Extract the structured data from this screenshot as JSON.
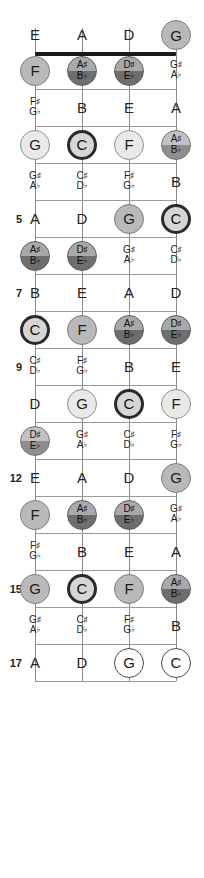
{
  "diagram": {
    "instrument": "4-string bass",
    "tuning": [
      "E",
      "A",
      "D",
      "G"
    ],
    "fret_range": [
      0,
      17
    ],
    "fret_markers": [
      "5",
      "7",
      "9",
      "12",
      "15",
      "17"
    ],
    "legend": {
      "root_color": "#2a2a2a",
      "scale_color": "#b9b9b9",
      "open_color": "#ffffff",
      "accidental_top": "#c2c2c2",
      "accidental_bottom": "#8e8e8e",
      "string_color": "#8a8a8a",
      "fret_color": "#9a9a9a",
      "nut_color": "#1a1a1a"
    }
  },
  "strings": [
    {
      "name": "string-1",
      "open_note": "E",
      "x": 35
    },
    {
      "name": "string-2",
      "open_note": "A",
      "x": 82
    },
    {
      "name": "string-3",
      "open_note": "D",
      "x": 129
    },
    {
      "name": "string-4",
      "open_note": "G",
      "x": 176
    }
  ],
  "fret_numbers": [
    {
      "label": "5",
      "y": 274
    },
    {
      "label": "7",
      "y": 348
    },
    {
      "label": "9",
      "y": 422
    },
    {
      "label": "12",
      "y": 570
    },
    {
      "label": "15",
      "y": 718
    },
    {
      "label": "17",
      "y": 829
    }
  ],
  "notes": [
    {
      "fret": 0,
      "string": 1,
      "style": "plain",
      "text": "E"
    },
    {
      "fret": 0,
      "string": 2,
      "style": "plain",
      "text": "A"
    },
    {
      "fret": 0,
      "string": 3,
      "style": "plain",
      "text": "D"
    },
    {
      "fret": 0,
      "string": 4,
      "style": "circle",
      "fill": "f-mid",
      "text": "G"
    },
    {
      "fret": 1,
      "string": 1,
      "style": "circle",
      "fill": "f-mid",
      "text": "F"
    },
    {
      "fret": 1,
      "string": 2,
      "style": "circle-pair",
      "fill": "f-half-d",
      "sharp": "A",
      "flat": "B"
    },
    {
      "fret": 1,
      "string": 3,
      "style": "circle-pair",
      "fill": "f-half-d",
      "sharp": "D",
      "flat": "E"
    },
    {
      "fret": 1,
      "string": 4,
      "style": "pair",
      "sharp": "G",
      "flat": "A"
    },
    {
      "fret": 2,
      "string": 1,
      "style": "pair",
      "sharp": "F",
      "flat": "G"
    },
    {
      "fret": 2,
      "string": 2,
      "style": "plain",
      "text": "B"
    },
    {
      "fret": 2,
      "string": 3,
      "style": "plain",
      "text": "E"
    },
    {
      "fret": 2,
      "string": 4,
      "style": "plain",
      "text": "A"
    },
    {
      "fret": 3,
      "string": 1,
      "style": "circle",
      "fill": "f-lite",
      "text": "G"
    },
    {
      "fret": 3,
      "string": 2,
      "style": "circle",
      "fill": "f-root",
      "text": "C"
    },
    {
      "fret": 3,
      "string": 3,
      "style": "circle",
      "fill": "f-lite",
      "text": "F"
    },
    {
      "fret": 3,
      "string": 4,
      "style": "circle-pair",
      "fill": "f-half",
      "sharp": "A",
      "flat": "B"
    },
    {
      "fret": 4,
      "string": 1,
      "style": "pair",
      "sharp": "G",
      "flat": "A"
    },
    {
      "fret": 4,
      "string": 2,
      "style": "pair",
      "sharp": "C",
      "flat": "D"
    },
    {
      "fret": 4,
      "string": 3,
      "style": "pair",
      "sharp": "F",
      "flat": "G"
    },
    {
      "fret": 4,
      "string": 4,
      "style": "plain",
      "text": "B"
    },
    {
      "fret": 5,
      "string": 1,
      "style": "plain",
      "text": "A"
    },
    {
      "fret": 5,
      "string": 2,
      "style": "plain",
      "text": "D"
    },
    {
      "fret": 5,
      "string": 3,
      "style": "circle",
      "fill": "f-mid",
      "text": "G"
    },
    {
      "fret": 5,
      "string": 4,
      "style": "circle",
      "fill": "f-root",
      "text": "C"
    },
    {
      "fret": 6,
      "string": 1,
      "style": "circle-pair",
      "fill": "f-half-d",
      "sharp": "A",
      "flat": "B"
    },
    {
      "fret": 6,
      "string": 2,
      "style": "circle-pair",
      "fill": "f-half-d",
      "sharp": "D",
      "flat": "E"
    },
    {
      "fret": 6,
      "string": 3,
      "style": "pair",
      "sharp": "G",
      "flat": "A"
    },
    {
      "fret": 6,
      "string": 4,
      "style": "pair",
      "sharp": "C",
      "flat": "D"
    },
    {
      "fret": 7,
      "string": 1,
      "style": "plain",
      "text": "B"
    },
    {
      "fret": 7,
      "string": 2,
      "style": "plain",
      "text": "E"
    },
    {
      "fret": 7,
      "string": 3,
      "style": "plain",
      "text": "A"
    },
    {
      "fret": 7,
      "string": 4,
      "style": "plain",
      "text": "D"
    },
    {
      "fret": 8,
      "string": 1,
      "style": "circle",
      "fill": "f-root",
      "text": "C"
    },
    {
      "fret": 8,
      "string": 2,
      "style": "circle",
      "fill": "f-mid",
      "text": "F"
    },
    {
      "fret": 8,
      "string": 3,
      "style": "circle-pair",
      "fill": "f-half-d",
      "sharp": "A",
      "flat": "B"
    },
    {
      "fret": 8,
      "string": 4,
      "style": "circle-pair",
      "fill": "f-half-d",
      "sharp": "D",
      "flat": "E"
    },
    {
      "fret": 9,
      "string": 1,
      "style": "pair",
      "sharp": "C",
      "flat": "D"
    },
    {
      "fret": 9,
      "string": 2,
      "style": "pair",
      "sharp": "F",
      "flat": "G"
    },
    {
      "fret": 9,
      "string": 3,
      "style": "plain",
      "text": "B"
    },
    {
      "fret": 9,
      "string": 4,
      "style": "plain",
      "text": "E"
    },
    {
      "fret": 10,
      "string": 1,
      "style": "plain",
      "text": "D"
    },
    {
      "fret": 10,
      "string": 2,
      "style": "circle",
      "fill": "f-lite",
      "text": "G"
    },
    {
      "fret": 10,
      "string": 3,
      "style": "circle",
      "fill": "f-root",
      "text": "C"
    },
    {
      "fret": 10,
      "string": 4,
      "style": "circle",
      "fill": "f-lite",
      "text": "F"
    },
    {
      "fret": 11,
      "string": 1,
      "style": "circle-pair",
      "fill": "f-half",
      "sharp": "D",
      "flat": "E"
    },
    {
      "fret": 11,
      "string": 2,
      "style": "pair",
      "sharp": "G",
      "flat": "A"
    },
    {
      "fret": 11,
      "string": 3,
      "style": "pair",
      "sharp": "C",
      "flat": "D"
    },
    {
      "fret": 11,
      "string": 4,
      "style": "pair",
      "sharp": "F",
      "flat": "G"
    },
    {
      "fret": 12,
      "string": 1,
      "style": "plain",
      "text": "E"
    },
    {
      "fret": 12,
      "string": 2,
      "style": "plain",
      "text": "A"
    },
    {
      "fret": 12,
      "string": 3,
      "style": "plain",
      "text": "D"
    },
    {
      "fret": 12,
      "string": 4,
      "style": "circle",
      "fill": "f-mid",
      "text": "G"
    },
    {
      "fret": 13,
      "string": 1,
      "style": "circle",
      "fill": "f-mid",
      "text": "F"
    },
    {
      "fret": 13,
      "string": 2,
      "style": "circle-pair",
      "fill": "f-half-d",
      "sharp": "A",
      "flat": "B"
    },
    {
      "fret": 13,
      "string": 3,
      "style": "circle-pair",
      "fill": "f-half-d",
      "sharp": "D",
      "flat": "E"
    },
    {
      "fret": 13,
      "string": 4,
      "style": "pair",
      "sharp": "G",
      "flat": "A"
    },
    {
      "fret": 14,
      "string": 1,
      "style": "pair",
      "sharp": "F",
      "flat": "G"
    },
    {
      "fret": 14,
      "string": 2,
      "style": "plain",
      "text": "B"
    },
    {
      "fret": 14,
      "string": 3,
      "style": "plain",
      "text": "E"
    },
    {
      "fret": 14,
      "string": 4,
      "style": "plain",
      "text": "A"
    },
    {
      "fret": 15,
      "string": 1,
      "style": "circle",
      "fill": "f-mid",
      "text": "G"
    },
    {
      "fret": 15,
      "string": 2,
      "style": "circle",
      "fill": "f-root",
      "text": "C"
    },
    {
      "fret": 15,
      "string": 3,
      "style": "circle",
      "fill": "f-mid",
      "text": "F"
    },
    {
      "fret": 15,
      "string": 4,
      "style": "circle-pair",
      "fill": "f-half-d",
      "sharp": "A",
      "flat": "B"
    },
    {
      "fret": 16,
      "string": 1,
      "style": "pair",
      "sharp": "G",
      "flat": "A"
    },
    {
      "fret": 16,
      "string": 2,
      "style": "pair",
      "sharp": "C",
      "flat": "D"
    },
    {
      "fret": 16,
      "string": 3,
      "style": "pair",
      "sharp": "F",
      "flat": "G"
    },
    {
      "fret": 16,
      "string": 4,
      "style": "plain",
      "text": "B"
    },
    {
      "fret": 17,
      "string": 1,
      "style": "plain",
      "text": "A"
    },
    {
      "fret": 17,
      "string": 2,
      "style": "plain",
      "text": "D"
    },
    {
      "fret": 17,
      "string": 3,
      "style": "circle",
      "fill": "f-open",
      "text": "G"
    },
    {
      "fret": 17,
      "string": 4,
      "style": "circle",
      "fill": "f-open",
      "text": "C"
    }
  ]
}
